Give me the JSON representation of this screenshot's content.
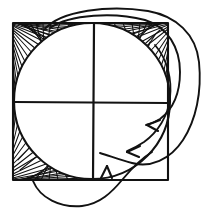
{
  "figure": {
    "title": "Square with inscribed circle and hatched corner regions",
    "background_color": "#ffffff",
    "ink_color": "#121212",
    "width": 207,
    "height": 214,
    "style": "hand-drawn line art, black ink on white"
  },
  "square": {
    "label": "bounding square",
    "x": 13,
    "y": 23,
    "width": 155,
    "height": 157,
    "stroke_width": 2.0
  },
  "circle": {
    "label": "inscribed circle",
    "cx": 92,
    "cy": 101,
    "r": 78,
    "stroke_width": 2.0
  },
  "crosshair": {
    "label": "center crosshair",
    "center_x": 94,
    "center_y": 102,
    "horizontal": {
      "x1": 14,
      "y1": 102,
      "x2": 168,
      "y2": 103
    },
    "vertical": {
      "x1": 94,
      "y1": 24,
      "x2": 93,
      "y2": 180
    },
    "stroke_width": 2.0
  },
  "hatched_regions": [
    {
      "name": "top-left-corner-hatch",
      "corner": "top-left",
      "lines": 26,
      "filled": true
    },
    {
      "name": "top-right-corner-hatch",
      "corner": "top-right",
      "lines": 26,
      "filled": true
    },
    {
      "name": "bottom-left-corner-hatch",
      "corner": "bottom-left",
      "lines": 26,
      "filled": true
    }
  ],
  "unhatched_regions": [
    {
      "name": "bottom-right-corner",
      "corner": "bottom-right",
      "filled": false
    }
  ],
  "annotation_curves": [
    {
      "name": "outer-loop-curve",
      "description": "large outer loop sweeping from top edge around the right side down to the lower right",
      "stroke_width": 2.0
    },
    {
      "name": "inner-loop-curve",
      "description": "inner loop running down the right side toward the upper arrowhead",
      "stroke_width": 2.0
    },
    {
      "name": "bottom-loop-curve",
      "description": "curve dipping below the bottom edge and rising to the bottom arrowhead",
      "stroke_width": 2.0
    }
  ],
  "arrows": [
    {
      "name": "arrow-upper-right",
      "tip_x": 148,
      "tip_y": 125,
      "direction": "left",
      "points_to": "top-right-corner-hatch"
    },
    {
      "name": "arrow-lower-right",
      "tip_x": 128,
      "tip_y": 152,
      "direction": "left",
      "points_to": "bottom-left-corner-hatch"
    },
    {
      "name": "arrow-bottom",
      "tip_x": 107,
      "tip_y": 166,
      "direction": "up",
      "points_to": "square-bottom-edge"
    }
  ]
}
